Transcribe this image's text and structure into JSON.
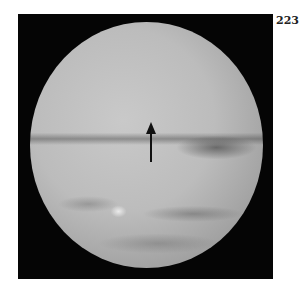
{
  "page": {
    "number": "223"
  },
  "figure": {
    "annotation": "arrow-pointing-up",
    "colors": {
      "background": "#050505",
      "disk_light": "#c9c9c9",
      "disk_edge": "#707070",
      "arrow": "#111111"
    }
  }
}
